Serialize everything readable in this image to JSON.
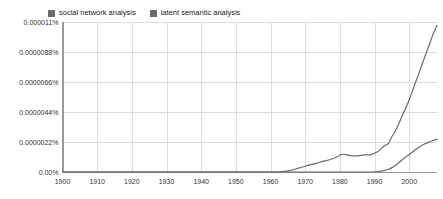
{
  "chart_data": {
    "type": "line",
    "title": "",
    "xlabel": "",
    "ylabel": "",
    "grid": true,
    "legend_position": "top-left",
    "xlim": [
      1900,
      2008
    ],
    "ylim": [
      0,
      1.1e-05
    ],
    "xticks": [
      1900,
      1910,
      1920,
      1930,
      1940,
      1950,
      1960,
      1970,
      1980,
      1990,
      2000
    ],
    "xtick_labels": [
      "1900",
      "1910",
      "1920",
      "1930",
      "1940",
      "1950",
      "1960",
      "1970",
      "1980",
      "1990",
      "2000"
    ],
    "yticks": [
      0,
      2.2e-06,
      4.4e-06,
      6.6e-06,
      8.8e-06,
      1.1e-05
    ],
    "ytick_labels": [
      "0.00%",
      "0.0000022%",
      "0.0000044%",
      "0.0000066%",
      "0.0000088%",
      "0.000011%"
    ],
    "series": [
      {
        "name": "social network analysis",
        "color": "#6b6b6b",
        "x": [
          1900,
          1910,
          1920,
          1930,
          1940,
          1950,
          1960,
          1963,
          1965,
          1967,
          1969,
          1971,
          1973,
          1975,
          1977,
          1979,
          1980,
          1981,
          1983,
          1985,
          1987,
          1989,
          1991,
          1992,
          1993,
          1994,
          1995,
          1996,
          1997,
          1998,
          1999,
          2000,
          2001,
          2002,
          2003,
          2004,
          2005,
          2006,
          2007,
          2008
        ],
        "values": [
          0,
          0,
          0,
          0,
          0,
          0,
          0,
          2e-08,
          8e-08,
          2e-07,
          3.5e-07,
          5e-07,
          6.2e-07,
          7.8e-07,
          9e-07,
          1.08e-06,
          1.25e-06,
          1.3e-06,
          1.2e-06,
          1.18e-06,
          1.25e-06,
          1.28e-06,
          1.5e-06,
          1.75e-06,
          1.95e-06,
          2.1e-06,
          2.6e-06,
          3e-06,
          3.55e-06,
          4.15e-06,
          4.7e-06,
          5.3e-06,
          6e-06,
          6.7e-06,
          7.4e-06,
          8.1e-06,
          8.8e-06,
          9.5e-06,
          1.02e-05,
          1.075e-05
        ]
      },
      {
        "name": "latent semantic analysis",
        "color": "#6b6b6b",
        "x": [
          1900,
          1910,
          1920,
          1930,
          1940,
          1950,
          1960,
          1970,
          1980,
          1985,
          1988,
          1990,
          1991,
          1992,
          1993,
          1994,
          1995,
          1996,
          1997,
          1998,
          1999,
          2000,
          2001,
          2002,
          2003,
          2004,
          2005,
          2006,
          2007,
          2008
        ],
        "values": [
          0,
          0,
          0,
          0,
          0,
          0,
          0,
          0,
          0,
          0,
          0,
          2e-08,
          4e-08,
          7e-08,
          1.2e-07,
          2e-07,
          3.2e-07,
          4.8e-07,
          6.8e-07,
          9e-07,
          1.1e-06,
          1.28e-06,
          1.48e-06,
          1.68e-06,
          1.85e-06,
          2e-06,
          2.12e-06,
          2.22e-06,
          2.32e-06,
          2.4e-06
        ]
      }
    ]
  },
  "legend": {
    "entries": [
      {
        "label": "social network analysis",
        "color": "#6b6b6b"
      },
      {
        "label": "latent semantic analysis",
        "color": "#6b6b6b"
      }
    ]
  },
  "colors": {
    "grid": "#dcdcdc",
    "axis": "#999999",
    "line": "#6b6b6b",
    "background": "#ffffff",
    "text": "#333333"
  }
}
